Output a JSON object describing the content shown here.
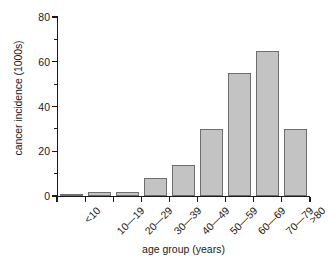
{
  "chart_data": {
    "type": "bar",
    "title": "",
    "xlabel": "age group (years)",
    "ylabel": "cancer incidence (1000s)",
    "categories": [
      "<10",
      "10—19",
      "20—29",
      "30—39",
      "40—49",
      "50—59",
      "60—69",
      "70—79",
      ">80"
    ],
    "values": [
      1,
      2,
      2,
      8,
      14,
      30,
      55,
      65,
      30
    ],
    "ylim": [
      0,
      80
    ],
    "ytick_labels": [
      "0",
      "20",
      "40",
      "60",
      "80"
    ],
    "ytick_values": [
      0,
      20,
      40,
      60,
      80
    ],
    "yminor_values": [
      10,
      30,
      50,
      70
    ],
    "grid": false,
    "legend": false,
    "bar_fill": "#c3c3c3",
    "bar_edge": "#6e6e6e",
    "axis_color": "#1a1a1a"
  }
}
